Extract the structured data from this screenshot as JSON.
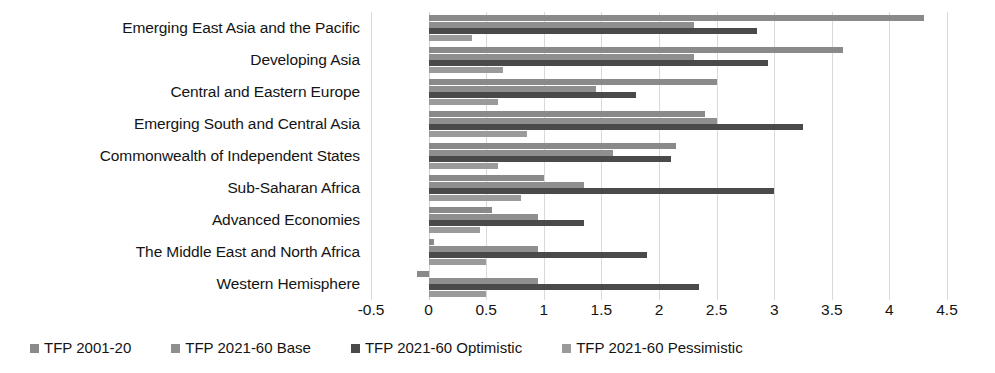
{
  "chart_data": {
    "type": "bar",
    "orientation": "horizontal",
    "title": "",
    "subtitle": "",
    "xlabel": "",
    "ylabel": "",
    "xlim": [
      -0.5,
      4.5
    ],
    "xticks": [
      "-0.5",
      "0",
      "0.5",
      "1",
      "1.5",
      "2",
      "2.5",
      "3",
      "3.5",
      "4",
      "4.5"
    ],
    "xtick_values": [
      -0.5,
      0,
      0.5,
      1,
      1.5,
      2,
      2.5,
      3,
      3.5,
      4,
      4.5
    ],
    "grid": true,
    "grid_axis": "x",
    "legend_position": "bottom",
    "categories": [
      "Emerging East Asia and the Pacific",
      "Developing Asia",
      "Central and Eastern Europe",
      "Emerging South and Central Asia",
      "Commonwealth of Independent States",
      "Sub-Saharan Africa",
      "Advanced Economies",
      "The Middle East and North Africa",
      "Western Hemisphere"
    ],
    "series": [
      {
        "name": "TFP 2001-20",
        "color": "#8a8a8a",
        "values": [
          4.3,
          3.6,
          2.5,
          2.4,
          2.15,
          1.0,
          0.55,
          0.05,
          -0.1
        ]
      },
      {
        "name": "TFP 2021-60 Base",
        "color": "#8f8f8f",
        "values": [
          2.3,
          2.3,
          1.45,
          2.5,
          1.6,
          1.35,
          0.95,
          0.95,
          0.95
        ]
      },
      {
        "name": "TFP 2021-60 Optimistic",
        "color": "#4a4a4a",
        "values": [
          2.85,
          2.95,
          1.8,
          3.25,
          2.1,
          3.0,
          1.35,
          1.9,
          2.35
        ]
      },
      {
        "name": "TFP 2021-60 Pessimistic",
        "color": "#9a9a9a",
        "values": [
          0.38,
          0.65,
          0.6,
          0.85,
          0.6,
          0.8,
          0.45,
          0.5,
          0.5
        ]
      }
    ]
  },
  "legend": {
    "items": [
      {
        "label": "TFP 2001-20",
        "color": "#8a8a8a",
        "marker": "square-marker"
      },
      {
        "label": "TFP 2021-60 Base",
        "color": "#8f8f8f",
        "marker": "square-marker"
      },
      {
        "label": "TFP 2021-60 Optimistic",
        "color": "#4a4a4a",
        "marker": "square-marker"
      },
      {
        "label": "TFP 2021-60 Pessimistic",
        "color": "#9a9a9a",
        "marker": "square-marker"
      }
    ]
  }
}
